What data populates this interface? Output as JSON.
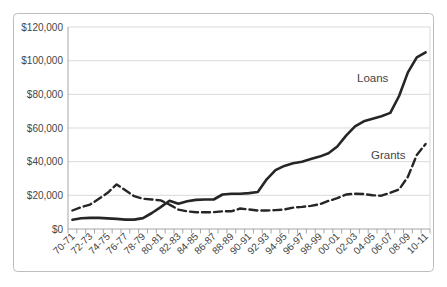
{
  "figure": {
    "background_color": "#ffffff",
    "border_color": "#bdbdbd",
    "gridline_color": "#d9d9d9",
    "axis_color": "#a6a6a6",
    "text_color": "#454545",
    "series_color": "#262626"
  },
  "chart_data": {
    "type": "line",
    "title": "",
    "xlabel": "",
    "ylabel": "",
    "ylim": [
      0,
      120000
    ],
    "ytick_step": 20000,
    "y_tick_labels": [
      "$0",
      "$20,000",
      "$40,000",
      "$60,000",
      "$80,000",
      "$100,000",
      "$120,000"
    ],
    "x_tick_labels": [
      "70-71",
      "72-73",
      "74-75",
      "76-77",
      "78-79",
      "80-81",
      "82-83",
      "84-85",
      "86-87",
      "88-89",
      "90-91",
      "92-93",
      "94-95",
      "96-97",
      "98-99",
      "00-01",
      "02-03",
      "04-05",
      "06-07",
      "08-09",
      "10-11"
    ],
    "x_resolution": "annual data points; axis labels shown every 2 years",
    "grid": "horizontal gridlines on",
    "legend_position": "inline annotations on lines",
    "series": [
      {
        "name": "Loans",
        "line_style": "solid",
        "annual_values": [
          5500,
          6400,
          6600,
          6600,
          6300,
          6000,
          5600,
          5600,
          6500,
          9500,
          13000,
          16800,
          15000,
          16500,
          17300,
          17500,
          17500,
          20500,
          21000,
          21000,
          21300,
          22000,
          29500,
          35000,
          37500,
          39000,
          40000,
          41500,
          43000,
          45000,
          49000,
          55500,
          61000,
          64000,
          65500,
          67000,
          69000,
          79000,
          93000,
          102000,
          105000
        ]
      },
      {
        "name": "Grants",
        "line_style": "dashed",
        "annual_values": [
          11000,
          13000,
          14500,
          18000,
          21500,
          26500,
          23000,
          19500,
          18000,
          17500,
          17000,
          14500,
          11500,
          10500,
          10000,
          10000,
          10000,
          10500,
          10500,
          12200,
          11600,
          11000,
          11000,
          11200,
          11600,
          12700,
          13100,
          13700,
          14700,
          16700,
          18300,
          20500,
          21000,
          20800,
          20000,
          19800,
          21500,
          23500,
          31000,
          44000,
          50500
        ]
      }
    ],
    "annotations": [
      {
        "text": "Loans"
      },
      {
        "text": "Grants"
      }
    ]
  }
}
